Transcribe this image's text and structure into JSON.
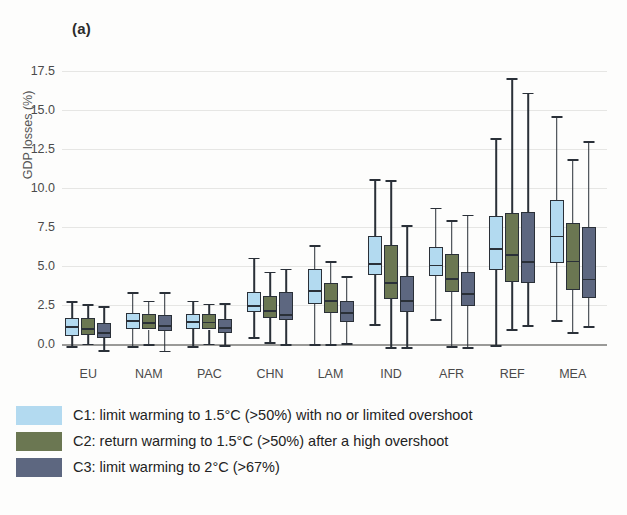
{
  "figure": {
    "panel_label": "(a)",
    "ylabel": "GDP losses (%)"
  },
  "legend": {
    "items": [
      {
        "label": "C1: limit warming to 1.5°C (>50%) with no or limited overshoot",
        "color": "#b3daf0",
        "swatch_name": "legend-swatch-c1"
      },
      {
        "label": "C2: return warming to 1.5°C (>50%) after a high overshoot",
        "color": "#6b7752",
        "swatch_name": "legend-swatch-c2"
      },
      {
        "label": "C3: limit warming to 2°C (>67%)",
        "color": "#5d6780",
        "swatch_name": "legend-swatch-c3"
      }
    ]
  },
  "chart_data": {
    "type": "box",
    "title": "(a)",
    "xlabel": "",
    "ylabel": "GDP losses (%)",
    "ylim": [
      -1.0,
      18.5
    ],
    "yticks": [
      0.0,
      2.5,
      5.0,
      7.5,
      10.0,
      12.5,
      15.0,
      17.5
    ],
    "ytick_labels": [
      "0.0",
      "2.5",
      "5.0",
      "7.5",
      "10.0",
      "12.5",
      "15.0",
      "17.5"
    ],
    "grid": true,
    "legend_position": "below",
    "categories": [
      "EU",
      "NAM",
      "PAC",
      "CHN",
      "LAM",
      "IND",
      "AFR",
      "REF",
      "MEA"
    ],
    "series": [
      {
        "name": "C1",
        "color": "#b3daf0",
        "boxes": [
          {
            "category": "EU",
            "whisker_low": -0.1,
            "q1": 0.55,
            "median": 1.15,
            "q3": 1.7,
            "whisker_high": 2.75
          },
          {
            "category": "NAM",
            "whisker_low": -0.1,
            "q1": 1.0,
            "median": 1.55,
            "q3": 2.0,
            "whisker_high": 3.35
          },
          {
            "category": "PAC",
            "whisker_low": -0.1,
            "q1": 1.0,
            "median": 1.5,
            "q3": 1.95,
            "whisker_high": 2.8
          },
          {
            "category": "CHN",
            "whisker_low": 0.45,
            "q1": 2.05,
            "median": 2.5,
            "q3": 3.35,
            "whisker_high": 5.55
          },
          {
            "category": "LAM",
            "whisker_low": 0.0,
            "q1": 2.6,
            "median": 3.45,
            "q3": 4.8,
            "whisker_high": 6.35
          },
          {
            "category": "IND",
            "whisker_low": 1.3,
            "q1": 4.45,
            "median": 5.2,
            "q3": 6.95,
            "whisker_high": 10.55
          },
          {
            "category": "AFR",
            "whisker_low": 1.6,
            "q1": 4.4,
            "median": 5.1,
            "q3": 6.25,
            "whisker_high": 8.75
          },
          {
            "category": "REF",
            "whisker_low": -0.05,
            "q1": 4.75,
            "median": 6.15,
            "q3": 8.2,
            "whisker_high": 13.2
          },
          {
            "category": "MEA",
            "whisker_low": 1.55,
            "q1": 5.2,
            "median": 6.95,
            "q3": 9.25,
            "whisker_high": 14.6
          }
        ]
      },
      {
        "name": "C2",
        "color": "#6b7752",
        "boxes": [
          {
            "category": "EU",
            "whisker_low": 0.05,
            "q1": 0.6,
            "median": 1.05,
            "q3": 1.7,
            "whisker_high": 2.55
          },
          {
            "category": "NAM",
            "whisker_low": 0.0,
            "q1": 0.95,
            "median": 1.4,
            "q3": 1.95,
            "whisker_high": 2.8
          },
          {
            "category": "PAC",
            "whisker_low": 0.05,
            "q1": 0.95,
            "median": 1.45,
            "q3": 1.95,
            "whisker_high": 2.6
          },
          {
            "category": "CHN",
            "whisker_low": 0.15,
            "q1": 1.7,
            "median": 2.2,
            "q3": 3.1,
            "whisker_high": 4.65
          },
          {
            "category": "LAM",
            "whisker_low": 0.0,
            "q1": 2.0,
            "median": 2.85,
            "q3": 3.95,
            "whisker_high": 5.3
          },
          {
            "category": "IND",
            "whisker_low": -0.15,
            "q1": 2.9,
            "median": 4.0,
            "q3": 6.35,
            "whisker_high": 10.5
          },
          {
            "category": "AFR",
            "whisker_low": -0.1,
            "q1": 3.35,
            "median": 4.25,
            "q3": 5.75,
            "whisker_high": 7.95
          },
          {
            "category": "REF",
            "whisker_low": 1.0,
            "q1": 4.0,
            "median": 5.75,
            "q3": 8.4,
            "whisker_high": 17.0
          },
          {
            "category": "MEA",
            "whisker_low": 0.8,
            "q1": 3.5,
            "median": 5.35,
            "q3": 7.75,
            "whisker_high": 11.85
          }
        ]
      },
      {
        "name": "C3",
        "color": "#5d6780",
        "boxes": [
          {
            "category": "EU",
            "whisker_low": -0.35,
            "q1": 0.4,
            "median": 0.8,
            "q3": 1.35,
            "whisker_high": 2.45
          },
          {
            "category": "NAM",
            "whisker_low": -0.4,
            "q1": 0.85,
            "median": 1.25,
            "q3": 1.9,
            "whisker_high": 3.35
          },
          {
            "category": "PAC",
            "whisker_low": -0.05,
            "q1": 0.75,
            "median": 1.1,
            "q3": 1.65,
            "whisker_high": 2.65
          },
          {
            "category": "CHN",
            "whisker_low": 0.0,
            "q1": 1.55,
            "median": 1.95,
            "q3": 3.35,
            "whisker_high": 4.85
          },
          {
            "category": "LAM",
            "whisker_low": 0.1,
            "q1": 1.45,
            "median": 2.05,
            "q3": 2.8,
            "whisker_high": 4.35
          },
          {
            "category": "IND",
            "whisker_low": -0.2,
            "q1": 2.05,
            "median": 2.85,
            "q3": 4.35,
            "whisker_high": 7.6
          },
          {
            "category": "AFR",
            "whisker_low": -0.2,
            "q1": 2.45,
            "median": 3.3,
            "q3": 4.6,
            "whisker_high": 8.3
          },
          {
            "category": "REF",
            "whisker_low": 1.25,
            "q1": 3.95,
            "median": 5.3,
            "q3": 8.45,
            "whisker_high": 16.1
          },
          {
            "category": "MEA",
            "whisker_low": 1.15,
            "q1": 2.95,
            "median": 4.2,
            "q3": 7.5,
            "whisker_high": 13.0
          }
        ]
      }
    ]
  }
}
